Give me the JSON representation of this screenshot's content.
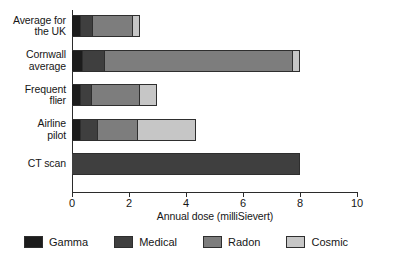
{
  "chart_data": {
    "type": "bar",
    "orientation": "horizontal",
    "stacked": true,
    "title": "",
    "xlabel": "Annual dose (milliSievert)",
    "ylabel": "",
    "xlim": [
      0,
      10
    ],
    "xticks": [
      0,
      2,
      4,
      6,
      8,
      10
    ],
    "xticklabels": [
      "0",
      "2",
      "4",
      "6",
      "8",
      "10"
    ],
    "grid": false,
    "legend_position": "bottom",
    "categories": [
      "Average for the UK",
      "Cornwall average",
      "Frequent flier",
      "Airline pilot",
      "CT scan"
    ],
    "category_label_lines": [
      [
        "Average for",
        "the UK"
      ],
      [
        "Cornwall",
        "average"
      ],
      [
        "Frequent",
        "flier"
      ],
      [
        "Airline",
        "pilot"
      ],
      [
        "CT scan"
      ]
    ],
    "series": [
      {
        "name": "Gamma",
        "color": "#1c1c1c",
        "values": [
          0.3,
          0.4,
          0.3,
          0.3,
          0.0
        ]
      },
      {
        "name": "Medical",
        "color": "#3f3f3f",
        "values": [
          0.45,
          0.75,
          0.4,
          0.6,
          8.0
        ]
      },
      {
        "name": "Radon",
        "color": "#7d7d7d",
        "values": [
          1.4,
          6.6,
          1.7,
          1.4,
          0.0
        ]
      },
      {
        "name": "Cosmic",
        "color": "#c6c6c6",
        "values": [
          0.25,
          0.25,
          0.6,
          2.05,
          0.0
        ]
      }
    ],
    "totals": [
      2.4,
      8.0,
      3.0,
      4.35,
      8.0
    ]
  },
  "legend": {
    "items": [
      {
        "label": "Gamma",
        "color": "#1c1c1c"
      },
      {
        "label": "Medical",
        "color": "#3f3f3f"
      },
      {
        "label": "Radon",
        "color": "#7d7d7d"
      },
      {
        "label": "Cosmic",
        "color": "#c6c6c6"
      }
    ]
  },
  "axis": {
    "x_title": "Annual dose (milliSievert)"
  }
}
